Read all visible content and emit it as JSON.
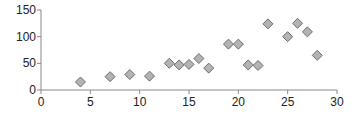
{
  "chart_data": {
    "type": "scatter",
    "title": "",
    "xlabel": "",
    "ylabel": "",
    "xlim": [
      0,
      30
    ],
    "ylim": [
      0,
      150
    ],
    "xticks": [
      0,
      5,
      10,
      15,
      20,
      25,
      30
    ],
    "yticks": [
      0,
      50,
      100,
      150
    ],
    "grid": false,
    "legend": null,
    "marker": "diamond",
    "marker_fill": "#b3b3b3",
    "marker_stroke": "#6e6e6e",
    "axis_color": "#888888",
    "series": [
      {
        "name": "",
        "points": [
          {
            "x": 4,
            "y": 15
          },
          {
            "x": 7,
            "y": 25
          },
          {
            "x": 9,
            "y": 29
          },
          {
            "x": 11,
            "y": 26
          },
          {
            "x": 13,
            "y": 50
          },
          {
            "x": 14,
            "y": 47
          },
          {
            "x": 15,
            "y": 48
          },
          {
            "x": 16,
            "y": 59
          },
          {
            "x": 17,
            "y": 41
          },
          {
            "x": 19,
            "y": 86
          },
          {
            "x": 20,
            "y": 86
          },
          {
            "x": 21,
            "y": 47
          },
          {
            "x": 22,
            "y": 46
          },
          {
            "x": 23,
            "y": 124
          },
          {
            "x": 25,
            "y": 100
          },
          {
            "x": 26,
            "y": 125
          },
          {
            "x": 27,
            "y": 109
          },
          {
            "x": 28,
            "y": 65
          }
        ]
      }
    ]
  }
}
